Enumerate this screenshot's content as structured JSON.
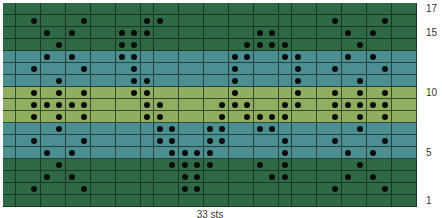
{
  "chart_data": {
    "type": "knitting-chart",
    "title": "",
    "columns": 33,
    "rows": 17,
    "caption": "33 sts",
    "row_labels": [
      {
        "row": 17,
        "label": "17"
      },
      {
        "row": 15,
        "label": "15"
      },
      {
        "row": 10,
        "label": "10"
      },
      {
        "row": 5,
        "label": "5"
      },
      {
        "row": 1,
        "label": "1"
      }
    ],
    "colors": {
      "dark_green": "#2f6a45",
      "teal": "#4b8f92",
      "lime": "#8fae5f",
      "dot": "#0b0b0b",
      "grid": "#1c3a28"
    },
    "row_colors": {
      "17": "dark_green",
      "16": "dark_green",
      "15": "dark_green",
      "14": "dark_green",
      "13": "teal",
      "12": "teal",
      "11": "teal",
      "10": "lime",
      "9": "lime",
      "8": "lime",
      "7": "teal",
      "6": "teal",
      "5": "teal",
      "4": "dark_green",
      "3": "dark_green",
      "2": "dark_green",
      "1": "dark_green"
    },
    "dots_by_row": {
      "17": [],
      "16": [
        2,
        6,
        11,
        12,
        26,
        30
      ],
      "15": [
        3,
        5,
        9,
        10,
        11,
        20,
        21,
        27,
        29
      ],
      "14": [
        4,
        9,
        10,
        19,
        20,
        21,
        22,
        28
      ],
      "13": [
        3,
        5,
        9,
        10,
        18,
        19,
        22,
        23,
        27,
        29
      ],
      "12": [
        2,
        6,
        10,
        18,
        23,
        26,
        30
      ],
      "11": [
        4,
        10,
        11,
        18,
        23,
        28
      ],
      "10": [
        2,
        4,
        6,
        10,
        11,
        18,
        23,
        26,
        28,
        30
      ],
      "9": [
        2,
        3,
        4,
        5,
        6,
        11,
        12,
        17,
        18,
        19,
        22,
        23,
        26,
        27,
        28,
        29,
        30
      ],
      "8": [
        2,
        4,
        6,
        11,
        12,
        17,
        19,
        20,
        21,
        22,
        26,
        28,
        30
      ],
      "7": [
        4,
        12,
        13,
        16,
        17,
        20,
        21,
        28
      ],
      "6": [
        2,
        6,
        12,
        13,
        16,
        17,
        22,
        26,
        30
      ],
      "5": [
        3,
        5,
        13,
        14,
        15,
        16,
        22,
        27,
        29
      ],
      "4": [
        4,
        13,
        14,
        15,
        16,
        20,
        22,
        28
      ],
      "3": [
        3,
        5,
        14,
        15,
        21,
        22,
        27,
        29
      ],
      "2": [
        2,
        6,
        14,
        15,
        26,
        30
      ],
      "1": []
    }
  }
}
